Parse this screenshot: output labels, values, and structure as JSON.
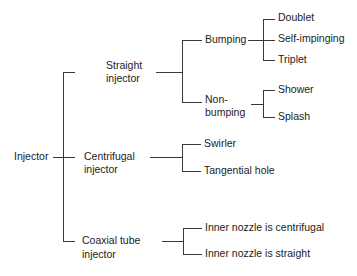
{
  "diagram": {
    "type": "tree",
    "root": {
      "label": "Injector",
      "children": [
        {
          "label_line1": "Straight",
          "label_line2": "injector",
          "children": [
            {
              "label": "Bumping",
              "children": [
                {
                  "label": "Doublet"
                },
                {
                  "label": "Self-impinging"
                },
                {
                  "label": "Triplet"
                }
              ]
            },
            {
              "label_line1": "Non-",
              "label_line2": "bumping",
              "children": [
                {
                  "label": "Shower"
                },
                {
                  "label": "Splash"
                }
              ]
            }
          ]
        },
        {
          "label_line1": "Centrifugal",
          "label_line2": "injector",
          "children": [
            {
              "label": "Swirler"
            },
            {
              "label": "Tangential hole"
            }
          ]
        },
        {
          "label_line1": "Coaxial tube",
          "label_line2": "injector",
          "children": [
            {
              "label": "Inner nozzle is centrifugal"
            },
            {
              "label": "Inner nozzle is straight"
            }
          ]
        }
      ]
    }
  }
}
